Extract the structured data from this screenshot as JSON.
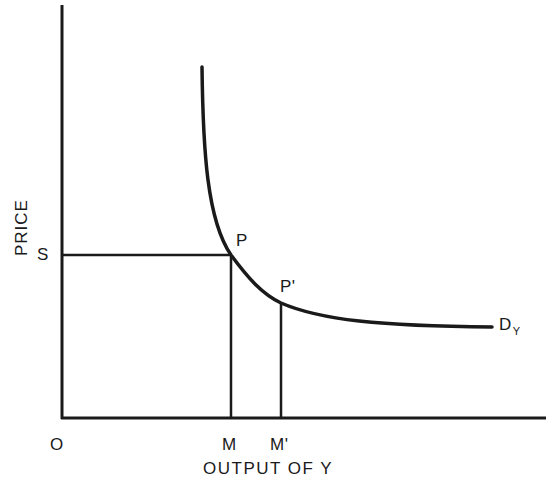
{
  "diagram": {
    "type": "demand-curve",
    "axes": {
      "y_label": "PRICE",
      "x_label": "OUTPUT OF Y",
      "origin_label": "O"
    },
    "curve": {
      "label": "D",
      "label_subscript": "Y",
      "shape": "rectangular-hyperbola-like downward-sloping demand curve"
    },
    "points": [
      {
        "id": "P",
        "label": "P",
        "price_label": "S",
        "quantity_label": "M"
      },
      {
        "id": "P_prime",
        "label": "P'",
        "quantity_label": "M'"
      }
    ],
    "axis_markers": {
      "price": "S",
      "quantities": [
        "M",
        "M'"
      ]
    },
    "colors": {
      "line": "#1a1a1a",
      "background": "#ffffff"
    }
  }
}
